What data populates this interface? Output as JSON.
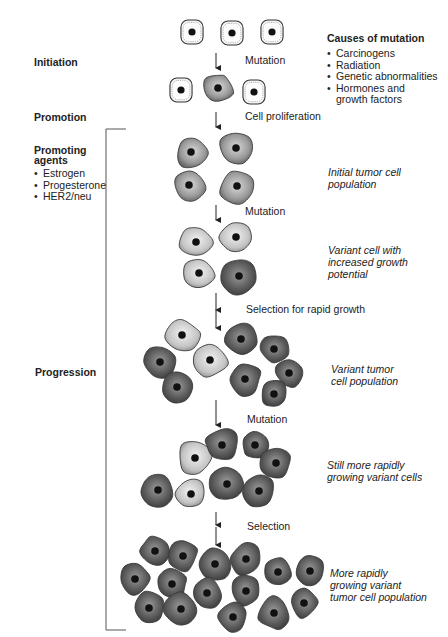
{
  "stages": {
    "initiation": "Initiation",
    "promotion": "Promotion",
    "progression": "Progression"
  },
  "causes_of_mutation": {
    "title": "Causes of mutation",
    "items": [
      "Carcinogens",
      "Radiation",
      "Genetic abnormalities",
      "Hormones and\ngrowth factors"
    ]
  },
  "promoting_agents": {
    "title": "Promoting\nagents",
    "items": [
      "Estrogen",
      "Progesterone",
      "HER2/neu"
    ]
  },
  "steps": {
    "mutation_1": "Mutation",
    "cell_proliferation": "Cell proliferation",
    "mutation_2": "Mutation",
    "selection_rapid": "Selection for rapid growth",
    "mutation_3": "Mutation",
    "selection": "Selection"
  },
  "populations": {
    "initial": "Initial tumor cell\npopulation",
    "variant_cell": "Variant cell with\nincreased growth\npotential",
    "variant_population": "Variant tumor\ncell population",
    "still_more": "Still more rapidly\ngrowing variant cells",
    "more_rapid": "More rapidly\ngrowing variant\ntumor cell population"
  },
  "colors": {
    "normal_fill": "#f4f4f4",
    "light_tumor": "#c9c9c9",
    "mid_tumor": "#8d8d8d",
    "dark_tumor": "#555555",
    "nucleus": "#111111",
    "stroke": "#333333"
  },
  "cells": [
    {
      "x": 192,
      "y": 32,
      "r": 13,
      "type": "normal"
    },
    {
      "x": 232,
      "y": 33,
      "r": 13,
      "type": "normal"
    },
    {
      "x": 272,
      "y": 32,
      "r": 13,
      "type": "normal"
    },
    {
      "x": 181,
      "y": 90,
      "r": 13,
      "type": "normal"
    },
    {
      "x": 218,
      "y": 88,
      "r": 15,
      "type": "mid"
    },
    {
      "x": 254,
      "y": 92,
      "r": 13,
      "type": "normal"
    },
    {
      "x": 191,
      "y": 152,
      "r": 16,
      "type": "mid"
    },
    {
      "x": 236,
      "y": 148,
      "r": 17,
      "type": "mid"
    },
    {
      "x": 189,
      "y": 185,
      "r": 16,
      "type": "mid"
    },
    {
      "x": 237,
      "y": 186,
      "r": 17,
      "type": "mid"
    },
    {
      "x": 196,
      "y": 242,
      "r": 16,
      "type": "light"
    },
    {
      "x": 236,
      "y": 237,
      "r": 16,
      "type": "light"
    },
    {
      "x": 199,
      "y": 273,
      "r": 15,
      "type": "light"
    },
    {
      "x": 239,
      "y": 276,
      "r": 18,
      "type": "dark"
    },
    {
      "x": 182,
      "y": 335,
      "r": 17,
      "type": "light"
    },
    {
      "x": 160,
      "y": 362,
      "r": 16,
      "type": "dark"
    },
    {
      "x": 210,
      "y": 360,
      "r": 17,
      "type": "light"
    },
    {
      "x": 241,
      "y": 339,
      "r": 17,
      "type": "dark"
    },
    {
      "x": 274,
      "y": 349,
      "r": 14,
      "type": "dark"
    },
    {
      "x": 177,
      "y": 387,
      "r": 16,
      "type": "dark"
    },
    {
      "x": 245,
      "y": 379,
      "r": 16,
      "type": "dark"
    },
    {
      "x": 289,
      "y": 373,
      "r": 14,
      "type": "dark"
    },
    {
      "x": 274,
      "y": 394,
      "r": 14,
      "type": "dark"
    },
    {
      "x": 195,
      "y": 458,
      "r": 17,
      "type": "light"
    },
    {
      "x": 222,
      "y": 445,
      "r": 17,
      "type": "dark"
    },
    {
      "x": 255,
      "y": 445,
      "r": 14,
      "type": "dark"
    },
    {
      "x": 276,
      "y": 463,
      "r": 15,
      "type": "dark"
    },
    {
      "x": 158,
      "y": 490,
      "r": 16,
      "type": "dark"
    },
    {
      "x": 191,
      "y": 494,
      "r": 15,
      "type": "light"
    },
    {
      "x": 227,
      "y": 484,
      "r": 17,
      "type": "dark"
    },
    {
      "x": 259,
      "y": 491,
      "r": 16,
      "type": "dark"
    },
    {
      "x": 155,
      "y": 551,
      "r": 15,
      "type": "dark"
    },
    {
      "x": 183,
      "y": 556,
      "r": 15,
      "type": "dark"
    },
    {
      "x": 215,
      "y": 564,
      "r": 16,
      "type": "dark"
    },
    {
      "x": 246,
      "y": 559,
      "r": 16,
      "type": "dark"
    },
    {
      "x": 278,
      "y": 572,
      "r": 14,
      "type": "dark"
    },
    {
      "x": 310,
      "y": 571,
      "r": 15,
      "type": "dark"
    },
    {
      "x": 135,
      "y": 579,
      "r": 15,
      "type": "dark"
    },
    {
      "x": 172,
      "y": 584,
      "r": 15,
      "type": "dark"
    },
    {
      "x": 207,
      "y": 593,
      "r": 15,
      "type": "dark"
    },
    {
      "x": 246,
      "y": 591,
      "r": 15,
      "type": "dark"
    },
    {
      "x": 304,
      "y": 603,
      "r": 14,
      "type": "dark"
    },
    {
      "x": 149,
      "y": 608,
      "r": 16,
      "type": "dark"
    },
    {
      "x": 181,
      "y": 609,
      "r": 16,
      "type": "dark"
    },
    {
      "x": 233,
      "y": 617,
      "r": 14,
      "type": "dark"
    },
    {
      "x": 274,
      "y": 613,
      "r": 16,
      "type": "dark"
    }
  ],
  "arrows": [
    {
      "x": 216,
      "y1": 53,
      "y2": 68
    },
    {
      "x": 216,
      "y1": 112,
      "y2": 127
    },
    {
      "x": 216,
      "y1": 205,
      "y2": 220
    },
    {
      "x": 216,
      "y1": 293,
      "y2": 310
    },
    {
      "x": 216,
      "y1": 310,
      "y2": 328
    },
    {
      "x": 216,
      "y1": 400,
      "y2": 425
    },
    {
      "x": 216,
      "y1": 512,
      "y2": 525
    },
    {
      "x": 216,
      "y1": 527,
      "y2": 545
    }
  ],
  "bracket": {
    "x": 106,
    "top": 129,
    "bottom": 630,
    "tick": 20
  }
}
